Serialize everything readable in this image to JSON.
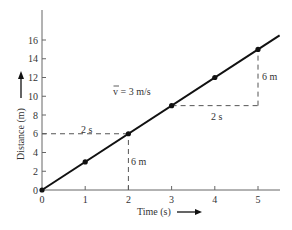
{
  "chart_data": {
    "type": "line",
    "title": "",
    "xlabel": "Time (s)",
    "ylabel": "Distance (m)",
    "x": [
      0,
      1,
      2,
      3,
      4,
      5
    ],
    "series": [
      {
        "name": "distance",
        "values": [
          0,
          3,
          6,
          9,
          12,
          15
        ]
      }
    ],
    "xlim": [
      0,
      5.5
    ],
    "ylim": [
      0,
      18
    ],
    "x_ticks": [
      "0",
      "1",
      "2",
      "3",
      "4",
      "5"
    ],
    "y_ticks": [
      "0",
      "2",
      "4",
      "6",
      "8",
      "10",
      "12",
      "14",
      "16"
    ],
    "grid": false,
    "legend": "none",
    "annotations": [
      {
        "text": "v̄ = 3 m/s",
        "kind": "average-velocity-label"
      },
      {
        "text": "2 s",
        "kind": "horizontal-run",
        "from": [
          0,
          6
        ],
        "to": [
          2,
          6
        ]
      },
      {
        "text": "6 m",
        "kind": "vertical-rise",
        "from": [
          2,
          0
        ],
        "to": [
          2,
          6
        ]
      },
      {
        "text": "2 s",
        "kind": "horizontal-run",
        "from": [
          3,
          9
        ],
        "to": [
          5,
          9
        ]
      },
      {
        "text": "6 m",
        "kind": "vertical-rise",
        "from": [
          5,
          9
        ],
        "to": [
          5,
          15
        ]
      }
    ]
  },
  "labels": {
    "xlabel": "Time (s)",
    "ylabel": "Distance (m)",
    "velocity": "v = 3 m/s",
    "run1": "2 s",
    "rise1": "6 m",
    "run2": "2 s",
    "rise2": "6 m"
  },
  "colors": {
    "line": "#111111",
    "axis": "#666666",
    "dash": "#555555",
    "text": "#333333"
  }
}
